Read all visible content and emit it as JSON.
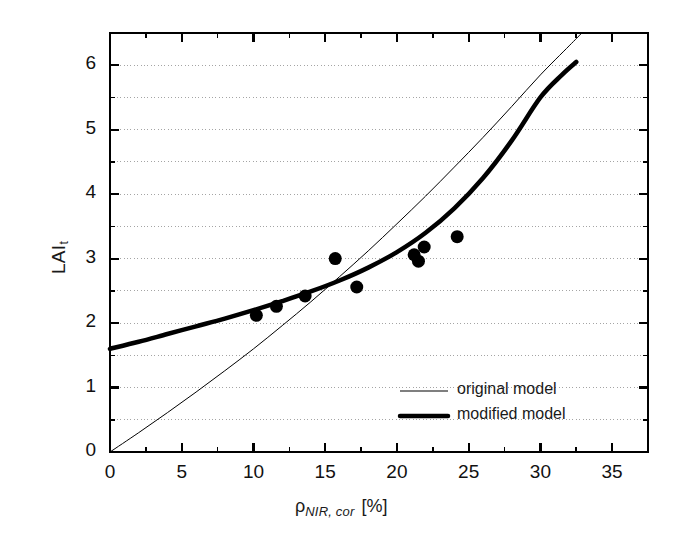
{
  "chart_data": {
    "type": "line",
    "title": "",
    "xlabel": "ρ",
    "xlabel_sub": "NIR, cor",
    "xlabel_unit": "[%]",
    "ylabel": "LAI",
    "ylabel_sub": "t",
    "xlim": [
      0,
      37.5
    ],
    "ylim": [
      0,
      6.5
    ],
    "xticks": [
      0,
      5,
      10,
      15,
      20,
      25,
      30,
      35
    ],
    "xtick_labels": [
      "0",
      "5",
      "10",
      "15",
      "20",
      "25",
      "30",
      "35"
    ],
    "xminor_step": 2.5,
    "yticks": [
      0,
      1,
      2,
      3,
      4,
      5,
      6
    ],
    "ytick_labels": [
      "0",
      "1",
      "2",
      "3",
      "4",
      "5",
      "6"
    ],
    "yminor_step": 0.5,
    "grid": "horizontal-dotted",
    "legend_position": "lower-right-inside",
    "series": [
      {
        "name": "original model",
        "style": "thin-line",
        "color": "#000000",
        "linewidth": 1,
        "x": [
          0.0,
          2.0,
          4.0,
          6.0,
          8.0,
          10.0,
          12.0,
          14.0,
          16.0,
          18.0,
          20.0,
          22.0,
          24.0,
          26.0,
          28.0,
          30.0,
          32.0,
          32.8
        ],
        "y": [
          0.0,
          0.3,
          0.61,
          0.93,
          1.26,
          1.6,
          1.96,
          2.33,
          2.72,
          3.12,
          3.54,
          3.97,
          4.42,
          4.88,
          5.36,
          5.85,
          6.3,
          6.48
        ]
      },
      {
        "name": "modified model",
        "style": "thick-line",
        "color": "#000000",
        "linewidth": 4.5,
        "x": [
          0.0,
          2.0,
          4.0,
          6.0,
          8.0,
          10.0,
          12.0,
          14.0,
          16.0,
          18.0,
          20.0,
          22.0,
          24.0,
          26.0,
          28.0,
          30.0,
          31.5,
          32.5
        ],
        "y": [
          1.6,
          1.71,
          1.83,
          1.95,
          2.07,
          2.2,
          2.34,
          2.49,
          2.66,
          2.86,
          3.1,
          3.4,
          3.78,
          4.25,
          4.83,
          5.5,
          5.85,
          6.05
        ]
      }
    ],
    "scatter": {
      "name": "observations",
      "marker": "filled-circle",
      "color": "#000000",
      "size": 13,
      "points": [
        {
          "x": 10.2,
          "y": 2.12
        },
        {
          "x": 11.6,
          "y": 2.26
        },
        {
          "x": 13.6,
          "y": 2.42
        },
        {
          "x": 15.7,
          "y": 3.0
        },
        {
          "x": 17.2,
          "y": 2.56
        },
        {
          "x": 21.2,
          "y": 3.06
        },
        {
          "x": 21.5,
          "y": 2.96
        },
        {
          "x": 21.9,
          "y": 3.18
        },
        {
          "x": 24.2,
          "y": 3.34
        }
      ]
    },
    "legend": [
      {
        "label": "original model",
        "style": "thin-line"
      },
      {
        "label": "modified model",
        "style": "thick-line"
      }
    ]
  }
}
